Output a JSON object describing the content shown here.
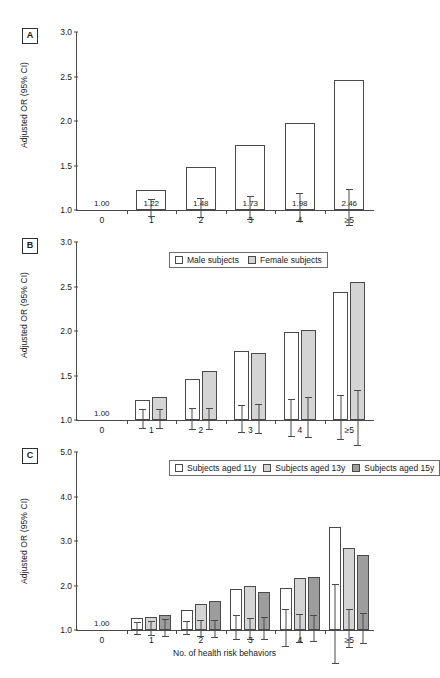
{
  "top_caption": "",
  "axis": {
    "ylabel": "Adjusted OR (95% CI)",
    "xlabel": "No. of health risk behaviors",
    "categories": [
      "0",
      "1",
      "2",
      "3",
      "4",
      "≥5"
    ],
    "reference_value": "1.00"
  },
  "panels": {
    "a": {
      "badge": "A",
      "yticks": [
        "3.0",
        "2.5",
        "2.0",
        "1.5",
        "1.0"
      ],
      "labels": [
        "1.00",
        "1.22",
        "1.48",
        "1.73",
        "1.98",
        "2.46"
      ]
    },
    "b": {
      "badge": "B",
      "yticks": [
        "3.0",
        "2.5",
        "2.0",
        "1.5",
        "1.0"
      ],
      "legend": [
        "Male subjects",
        "Female subjects"
      ]
    },
    "c": {
      "badge": "C",
      "yticks": [
        "5.0",
        "4.0",
        "3.0",
        "2.0",
        "1.0"
      ],
      "legend": [
        "Subjects aged 11y",
        "Subjects aged 13y",
        "Subjects aged 15y"
      ]
    }
  },
  "chart_data": [
    {
      "type": "bar",
      "panel": "A",
      "title": "",
      "xlabel": "No. of health risk behaviors",
      "ylabel": "Adjusted OR (95% CI)",
      "ylim": [
        1.0,
        3.0
      ],
      "yticks": [
        1.0,
        1.5,
        2.0,
        2.5,
        3.0
      ],
      "grid": false,
      "legend": null,
      "categories": [
        "0",
        "1",
        "2",
        "3",
        "4",
        "≥5"
      ],
      "values": [
        1.0,
        1.22,
        1.48,
        1.73,
        1.98,
        2.46
      ],
      "ci_low": [
        1.0,
        1.13,
        1.38,
        1.61,
        1.83,
        2.27
      ],
      "ci_high": [
        1.0,
        1.33,
        1.6,
        1.88,
        2.16,
        2.68
      ],
      "data_labels": [
        "1.00",
        "1.22",
        "1.48",
        "1.73",
        "1.98",
        "2.46"
      ],
      "annotations": [
        "1.00 is the reference category"
      ]
    },
    {
      "type": "bar",
      "panel": "B",
      "title": "",
      "xlabel": "No. of health risk behaviors",
      "ylabel": "Adjusted OR (95% CI)",
      "ylim": [
        1.0,
        3.0
      ],
      "yticks": [
        1.0,
        1.5,
        2.0,
        2.5,
        3.0
      ],
      "grid": false,
      "legend_position": "top-left",
      "categories": [
        "0",
        "1",
        "2",
        "3",
        "4",
        "≥5"
      ],
      "series": [
        {
          "name": "Male subjects",
          "values": [
            1.0,
            1.23,
            1.46,
            1.77,
            1.99,
            2.44
          ],
          "ci_low": [
            1.0,
            1.12,
            1.34,
            1.61,
            1.79,
            2.2
          ],
          "ci_high": [
            1.0,
            1.34,
            1.58,
            1.93,
            2.21,
            2.71
          ]
        },
        {
          "name": "Female subjects",
          "values": [
            1.0,
            1.26,
            1.55,
            1.75,
            2.01,
            2.55
          ],
          "ci_low": [
            1.0,
            1.15,
            1.43,
            1.58,
            1.8,
            2.25
          ],
          "ci_high": [
            1.0,
            1.37,
            1.67,
            1.92,
            2.26,
            2.88
          ]
        }
      ],
      "data_labels": [
        "1.00"
      ]
    },
    {
      "type": "bar",
      "panel": "C",
      "title": "",
      "xlabel": "No. of health risk behaviors",
      "ylabel": "Adjusted OR (95% CI)",
      "ylim": [
        1.0,
        5.0
      ],
      "yticks": [
        1.0,
        2.0,
        3.0,
        4.0,
        5.0
      ],
      "grid": false,
      "legend_position": "top-left",
      "categories": [
        "0",
        "1",
        "2",
        "3",
        "4",
        "≥5"
      ],
      "series": [
        {
          "name": "Subjects aged 11y",
          "values": [
            1.0,
            1.26,
            1.45,
            1.92,
            1.94,
            3.32
          ],
          "ci_low": [
            1.0,
            1.13,
            1.31,
            1.68,
            1.54,
            2.53
          ],
          "ci_high": [
            1.0,
            1.42,
            1.62,
            2.23,
            2.4,
            4.34
          ]
        },
        {
          "name": "Subjects aged 13y",
          "values": [
            1.0,
            1.3,
            1.58,
            2.0,
            2.16,
            2.85
          ],
          "ci_low": [
            1.0,
            1.14,
            1.41,
            1.75,
            1.85,
            2.43
          ],
          "ci_high": [
            1.0,
            1.47,
            1.79,
            2.25,
            2.5,
            3.3
          ]
        },
        {
          "name": "Subjects aged 15y",
          "values": [
            1.0,
            1.34,
            1.66,
            1.86,
            2.2,
            2.68
          ],
          "ci_low": [
            1.0,
            1.15,
            1.46,
            1.61,
            1.91,
            2.34
          ],
          "ci_high": [
            1.0,
            1.57,
            1.86,
            2.12,
            2.52,
            3.05
          ]
        }
      ],
      "data_labels": [
        "1.00"
      ]
    }
  ]
}
